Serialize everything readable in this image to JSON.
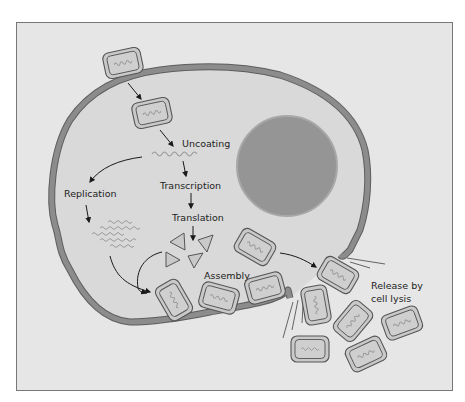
{
  "diagram": {
    "colors": {
      "page": "#ffffff",
      "frame_fill": "#e6e6e6",
      "frame_border": "#777777",
      "cytoplasm": "#d9d9d9",
      "membrane": "#8c8c8c",
      "membrane_outline": "#5e5e5e",
      "nucleus": "#959595",
      "nucleus_rim": "#a8a8a8",
      "virion_fill": "#c9c9c9",
      "virion_outline": "#555555",
      "nucleic_acid": "#9a9a9a",
      "arrow": "#1a1a1a"
    },
    "labels": {
      "uncoating": "Uncoating",
      "transcription": "Transcription",
      "translation": "Translation",
      "replication": "Replication",
      "assembly": "Assembly",
      "release_line1": "Release by",
      "release_line2": "cell lysis"
    },
    "stages": [
      "Attachment/entry",
      "Uncoating",
      "Transcription",
      "Translation",
      "Replication",
      "Assembly",
      "Release by cell lysis"
    ]
  }
}
